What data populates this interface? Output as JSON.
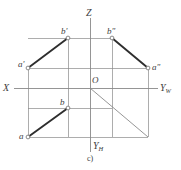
{
  "figure": {
    "caption": "c)",
    "axes": [
      {
        "name": "z-axis",
        "label": "Z",
        "sub": ""
      },
      {
        "name": "x-axis",
        "label": "X",
        "sub": ""
      },
      {
        "name": "yw-axis",
        "label": "Y",
        "sub": "W"
      },
      {
        "name": "yh-axis",
        "label": "Y",
        "sub": "H"
      }
    ],
    "origin_label": "O",
    "points": [
      {
        "name": "a-prime",
        "label": "a'",
        "x": 28,
        "y": 68
      },
      {
        "name": "b-prime",
        "label": "b'",
        "x": 68,
        "y": 38
      },
      {
        "name": "b-double-prime",
        "label": "b\"",
        "x": 112,
        "y": 38
      },
      {
        "name": "a-double-prime",
        "label": "a\"",
        "x": 148,
        "y": 68
      },
      {
        "name": "b-plain",
        "label": "b",
        "x": 68,
        "y": 108
      },
      {
        "name": "a-plain",
        "label": "a",
        "x": 28,
        "y": 137
      }
    ],
    "colors": {
      "thin_line": "#8a8a8a",
      "thick_line": "#2e2e2e",
      "marker_stroke": "#6f6f6f",
      "marker_fill": "#ffffff",
      "text": "#3d3d3d",
      "background": "#ffffff"
    },
    "geometry": {
      "origin": {
        "x": 90,
        "y": 88
      },
      "z_top": 18,
      "yh_bottom": 152,
      "x_left": 14,
      "yw_right": 158,
      "yh_diagonal_end": {
        "x": 148,
        "y": 137
      },
      "verticals_x": [
        28,
        68,
        112,
        148
      ],
      "horizontals_y": [
        38,
        68,
        108,
        137
      ],
      "thick_segments": [
        {
          "from": "a-prime",
          "to": "b-prime"
        },
        {
          "from": "b-double-prime",
          "to": "a-double-prime"
        },
        {
          "from": "a-plain",
          "to": "b-plain"
        }
      ]
    }
  }
}
